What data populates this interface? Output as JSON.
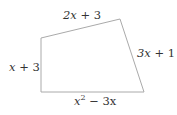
{
  "diagram": {
    "type": "quadrilateral",
    "stroke_color": "#aaaaaa",
    "text_color": "#333333",
    "vertices": {
      "top_left": [
        41,
        38
      ],
      "top_right": [
        120,
        19
      ],
      "bottom_right": [
        144,
        92
      ],
      "bottom_left": [
        41,
        92
      ]
    },
    "sides": {
      "top": {
        "var": "2x",
        "rest": " + 3",
        "full": "2x + 3"
      },
      "right": {
        "var": "3x",
        "rest": " + 1",
        "full": "3x + 1"
      },
      "left": {
        "var": "x",
        "rest": " + 3",
        "full": "x + 3"
      },
      "bottom": {
        "base": "x",
        "exp": "2",
        "rest": " − 3x",
        "full": "x² − 3x"
      }
    }
  }
}
